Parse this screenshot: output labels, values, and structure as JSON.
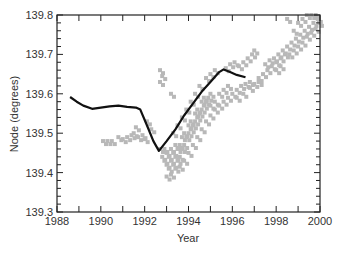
{
  "chart_data": {
    "type": "scatter",
    "title": "",
    "xlabel": "Year",
    "ylabel": "Node (degrees)",
    "xlim": [
      1988,
      2000
    ],
    "ylim": [
      139.3,
      139.8
    ],
    "x_ticks": [
      1988,
      1990,
      1992,
      1994,
      1996,
      1998,
      2000
    ],
    "y_ticks": [
      139.3,
      139.4,
      139.5,
      139.6,
      139.7,
      139.8
    ],
    "x_tick_labels": [
      "1988",
      "1990",
      "1992",
      "1994",
      "1996",
      "1998",
      "2000"
    ],
    "y_tick_labels": [
      "139.3",
      "139.4",
      "139.5",
      "139.6",
      "139.7",
      "139.8"
    ],
    "grid": false,
    "legend": null,
    "series": [
      {
        "name": "line",
        "kind": "line",
        "color": "#111111",
        "points": [
          [
            1988.6,
            139.592
          ],
          [
            1988.9,
            139.58
          ],
          [
            1989.2,
            139.57
          ],
          [
            1989.6,
            139.562
          ],
          [
            1990.0,
            139.565
          ],
          [
            1990.4,
            139.568
          ],
          [
            1990.8,
            139.57
          ],
          [
            1991.2,
            139.567
          ],
          [
            1991.6,
            139.565
          ],
          [
            1991.8,
            139.56
          ],
          [
            1992.1,
            139.52
          ],
          [
            1992.4,
            139.48
          ],
          [
            1992.65,
            139.455
          ],
          [
            1993.0,
            139.48
          ],
          [
            1993.4,
            139.51
          ],
          [
            1993.8,
            139.545
          ],
          [
            1994.2,
            139.575
          ],
          [
            1994.6,
            139.605
          ],
          [
            1995.0,
            139.63
          ],
          [
            1995.4,
            139.655
          ],
          [
            1995.6,
            139.662
          ],
          [
            1995.9,
            139.655
          ],
          [
            1996.2,
            139.648
          ],
          [
            1996.6,
            139.642
          ]
        ]
      },
      {
        "name": "observations",
        "kind": "scatter",
        "color": "#b8b8b8",
        "points": [
          [
            1990.1,
            139.48
          ],
          [
            1990.3,
            139.48
          ],
          [
            1990.5,
            139.48
          ],
          [
            1990.8,
            139.49
          ],
          [
            1991.0,
            139.485
          ],
          [
            1991.2,
            139.49
          ],
          [
            1991.4,
            139.495
          ],
          [
            1991.5,
            139.5
          ],
          [
            1991.7,
            139.49
          ],
          [
            1991.9,
            139.495
          ],
          [
            1992.0,
            139.485
          ],
          [
            1991.6,
            139.515
          ],
          [
            1992.3,
            139.51
          ],
          [
            1992.1,
            139.53
          ],
          [
            1992.7,
            139.63
          ],
          [
            1992.8,
            139.645
          ],
          [
            1992.7,
            139.66
          ],
          [
            1993.2,
            139.6
          ],
          [
            1992.7,
            139.46
          ],
          [
            1992.8,
            139.44
          ],
          [
            1992.9,
            139.43
          ],
          [
            1993.0,
            139.42
          ],
          [
            1993.1,
            139.41
          ],
          [
            1992.9,
            139.46
          ],
          [
            1993.0,
            139.45
          ],
          [
            1993.1,
            139.44
          ],
          [
            1993.2,
            139.43
          ],
          [
            1993.3,
            139.42
          ],
          [
            1993.2,
            139.46
          ],
          [
            1993.3,
            139.45
          ],
          [
            1993.4,
            139.44
          ],
          [
            1993.5,
            139.43
          ],
          [
            1993.6,
            139.44
          ],
          [
            1993.4,
            139.47
          ],
          [
            1993.5,
            139.46
          ],
          [
            1993.6,
            139.47
          ],
          [
            1993.7,
            139.46
          ],
          [
            1993.8,
            139.47
          ],
          [
            1993.7,
            139.49
          ],
          [
            1993.8,
            139.5
          ],
          [
            1993.9,
            139.49
          ],
          [
            1994.0,
            139.5
          ],
          [
            1994.1,
            139.51
          ],
          [
            1994.0,
            139.52
          ],
          [
            1994.1,
            139.53
          ],
          [
            1994.2,
            139.52
          ],
          [
            1994.3,
            139.53
          ],
          [
            1994.4,
            139.54
          ],
          [
            1994.3,
            139.55
          ],
          [
            1994.4,
            139.56
          ],
          [
            1994.5,
            139.55
          ],
          [
            1994.6,
            139.56
          ],
          [
            1994.7,
            139.57
          ],
          [
            1994.6,
            139.58
          ],
          [
            1994.7,
            139.59
          ],
          [
            1994.8,
            139.58
          ],
          [
            1994.9,
            139.59
          ],
          [
            1995.0,
            139.6
          ],
          [
            1995.0,
            139.57
          ],
          [
            1995.2,
            139.58
          ],
          [
            1995.4,
            139.6
          ],
          [
            1995.6,
            139.61
          ],
          [
            1995.8,
            139.62
          ],
          [
            1993.3,
            139.5
          ],
          [
            1993.5,
            139.52
          ],
          [
            1993.7,
            139.54
          ],
          [
            1993.9,
            139.56
          ],
          [
            1994.1,
            139.58
          ],
          [
            1994.3,
            139.6
          ],
          [
            1994.5,
            139.62
          ],
          [
            1994.8,
            139.64
          ],
          [
            1995.0,
            139.65
          ],
          [
            1995.2,
            139.66
          ],
          [
            1993.0,
            139.39
          ],
          [
            1993.2,
            139.395
          ],
          [
            1993.4,
            139.41
          ],
          [
            1993.6,
            139.415
          ],
          [
            1993.8,
            139.43
          ],
          [
            1994.0,
            139.45
          ],
          [
            1994.2,
            139.47
          ],
          [
            1994.4,
            139.49
          ],
          [
            1994.6,
            139.51
          ],
          [
            1994.8,
            139.53
          ],
          [
            1995.0,
            139.545
          ],
          [
            1995.2,
            139.56
          ],
          [
            1995.4,
            139.57
          ],
          [
            1995.6,
            139.58
          ],
          [
            1995.8,
            139.59
          ],
          [
            1995.7,
            139.665
          ],
          [
            1995.9,
            139.675
          ],
          [
            1996.1,
            139.68
          ],
          [
            1996.3,
            139.67
          ],
          [
            1996.5,
            139.68
          ],
          [
            1996.0,
            139.6
          ],
          [
            1996.2,
            139.61
          ],
          [
            1996.4,
            139.62
          ],
          [
            1996.6,
            139.625
          ],
          [
            1996.8,
            139.63
          ],
          [
            1996.2,
            139.59
          ],
          [
            1996.5,
            139.6
          ],
          [
            1996.8,
            139.615
          ],
          [
            1997.0,
            139.625
          ],
          [
            1997.2,
            139.63
          ],
          [
            1996.7,
            139.69
          ],
          [
            1996.9,
            139.7
          ],
          [
            1997.0,
            139.71
          ],
          [
            1997.2,
            139.64
          ],
          [
            1997.4,
            139.65
          ],
          [
            1997.6,
            139.66
          ],
          [
            1997.8,
            139.67
          ],
          [
            1998.0,
            139.68
          ],
          [
            1998.2,
            139.69
          ],
          [
            1998.4,
            139.7
          ],
          [
            1997.5,
            139.675
          ],
          [
            1997.7,
            139.685
          ],
          [
            1997.9,
            139.69
          ],
          [
            1998.1,
            139.7
          ],
          [
            1998.3,
            139.71
          ],
          [
            1998.5,
            139.72
          ],
          [
            1998.7,
            139.73
          ],
          [
            1998.9,
            139.74
          ],
          [
            1999.1,
            139.75
          ],
          [
            1999.3,
            139.76
          ],
          [
            1998.6,
            139.7
          ],
          [
            1998.8,
            139.71
          ],
          [
            1999.0,
            139.72
          ],
          [
            1999.2,
            139.73
          ],
          [
            1999.4,
            139.745
          ],
          [
            1999.5,
            139.77
          ],
          [
            1999.7,
            139.78
          ],
          [
            1999.9,
            139.79
          ],
          [
            1999.6,
            139.8
          ],
          [
            1999.8,
            139.8
          ],
          [
            1998.8,
            139.76
          ],
          [
            1999.0,
            139.78
          ],
          [
            1999.2,
            139.79
          ],
          [
            1999.4,
            139.8
          ],
          [
            1998.5,
            139.79
          ],
          [
            1999.6,
            139.755
          ],
          [
            1999.8,
            139.765
          ],
          [
            1999.95,
            139.78
          ],
          [
            1998.2,
            139.67
          ],
          [
            1998.0,
            139.66
          ]
        ]
      }
    ]
  },
  "axes": {
    "xlabel": "Year",
    "ylabel": "Node (degrees)"
  }
}
